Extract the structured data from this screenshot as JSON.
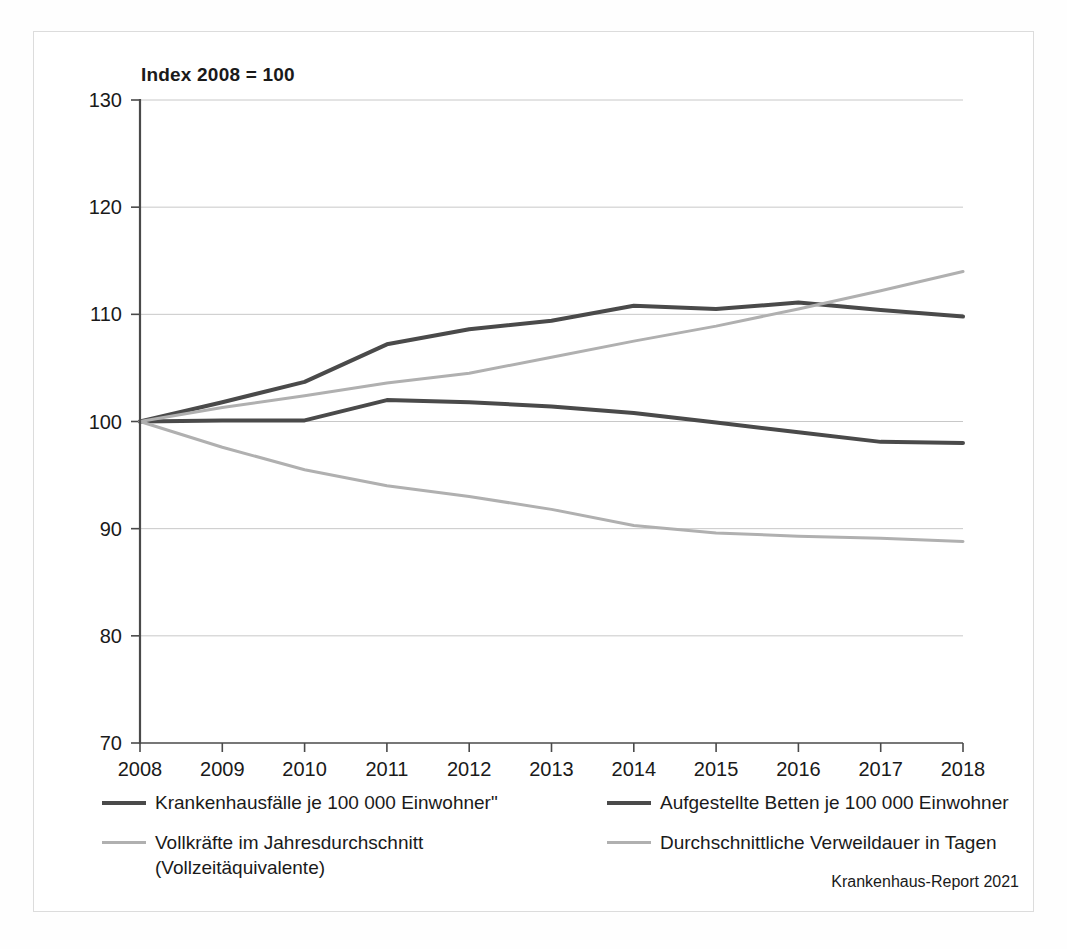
{
  "figure": {
    "title": "Index 2008  = 100",
    "source_note": "Krankenhaus-Report 2021"
  },
  "colors": {
    "series_dark": "#4a4a4a",
    "series_light": "#b0b0b0",
    "axis": "#4a4a4a",
    "grid": "#c8c8c8",
    "text": "#1a1a1a",
    "frame": "#dcdcdc",
    "background": "#ffffff"
  },
  "legend": {
    "left": [
      {
        "label": "Krankenhausfälle je 100 000 Einwohner\"",
        "color": "#4a4a4a",
        "weight": "thick"
      },
      {
        "label": "Vollkräfte im Jahresdurchschnitt\n(Vollzeitäquivalente)",
        "color": "#b0b0b0",
        "weight": "thin"
      }
    ],
    "right": [
      {
        "label": "Aufgestellte Betten je 100 000 Einwohner",
        "color": "#4a4a4a",
        "weight": "thick"
      },
      {
        "label": "Durchschnittliche Verweildauer in Tagen",
        "color": "#b0b0b0",
        "weight": "thin"
      }
    ]
  },
  "chart_data": {
    "type": "line",
    "title": "Index 2008  = 100",
    "xlabel": "",
    "ylabel": "",
    "x": [
      2008,
      2009,
      2010,
      2011,
      2012,
      2013,
      2014,
      2015,
      2016,
      2017,
      2018
    ],
    "xticklabels": [
      "2008",
      "2009",
      "2010",
      "2011",
      "2012",
      "2013",
      "2014",
      "2015",
      "2016",
      "2017",
      "2018"
    ],
    "ylim": [
      70,
      130
    ],
    "yticks": [
      70,
      80,
      90,
      100,
      110,
      120,
      130
    ],
    "yticklabels": [
      "70",
      "80",
      "90",
      "100",
      "110",
      "120",
      "130"
    ],
    "grid": true,
    "grid_axis": "y",
    "legend_position": "below",
    "series": [
      {
        "name": "Krankenhausfälle je 100 000 Einwohner\"",
        "color": "#4a4a4a",
        "width": 4,
        "values": [
          100.0,
          101.8,
          103.7,
          107.2,
          108.6,
          109.4,
          110.8,
          110.5,
          111.1,
          110.4,
          109.8
        ]
      },
      {
        "name": "Aufgestellte Betten je 100 000 Einwohner",
        "color": "#4a4a4a",
        "width": 4,
        "values": [
          100.0,
          100.1,
          100.1,
          102.0,
          101.8,
          101.4,
          100.8,
          99.9,
          99.0,
          98.1,
          98.0
        ]
      },
      {
        "name": "Vollkräfte im Jahresdurchschnitt (Vollzeitäquivalente)",
        "color": "#b0b0b0",
        "width": 3,
        "values": [
          100.0,
          101.3,
          102.4,
          103.6,
          104.5,
          106.0,
          107.5,
          108.9,
          110.5,
          112.2,
          114.0
        ]
      },
      {
        "name": "Durchschnittliche Verweildauer in Tagen",
        "color": "#b0b0b0",
        "width": 3,
        "values": [
          100.0,
          97.6,
          95.5,
          94.0,
          93.0,
          91.8,
          90.3,
          89.6,
          89.3,
          89.1,
          88.8
        ]
      }
    ]
  }
}
